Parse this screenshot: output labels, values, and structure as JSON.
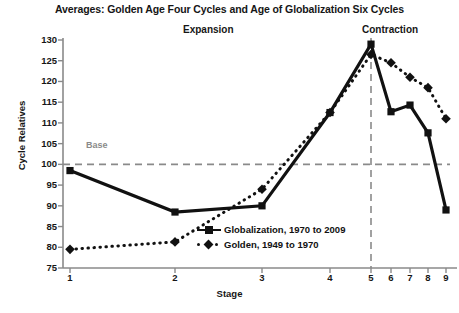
{
  "chart_data": {
    "type": "line",
    "title": "Averages: Golden Age Four Cycles and Age of Globalization Six Cycles",
    "xlabel": "Stage",
    "ylabel": "Cycle Relatives",
    "categories": [
      "1",
      "2",
      "3",
      "4",
      "5",
      "6",
      "7",
      "8",
      "9"
    ],
    "xtick_labels": [
      "1",
      "2",
      "3",
      "4",
      "5",
      "6",
      "7",
      "8",
      "9"
    ],
    "ytick_labels": [
      "130",
      "125",
      "120",
      "115",
      "110",
      "105",
      "100",
      "95",
      "90",
      "85",
      "80",
      "75"
    ],
    "ylim": [
      75,
      130
    ],
    "ytick_step": 5,
    "grid": false,
    "legend_position": "inside-center",
    "series": [
      {
        "name": "Globalization, 1970 to 2009",
        "style": "solid",
        "marker": "square",
        "color": "#111111",
        "x": [
          1,
          2,
          3,
          4,
          5,
          6,
          7,
          8,
          9
        ],
        "values": [
          98.5,
          88.5,
          90.0,
          112.5,
          129.0,
          112.7,
          114.3,
          107.6,
          89.0
        ]
      },
      {
        "name": "Golden, 1949 to 1970",
        "style": "dotted",
        "marker": "diamond",
        "color": "#111111",
        "x": [
          1,
          2,
          3,
          4,
          5,
          6,
          7,
          8,
          9
        ],
        "values": [
          79.5,
          81.3,
          94.0,
          112.5,
          126.5,
          124.5,
          121.0,
          118.5,
          111.0
        ]
      }
    ],
    "annotations": [
      {
        "name": "expansion",
        "text": "Expansion"
      },
      {
        "name": "contraction",
        "text": "Contraction"
      },
      {
        "name": "base",
        "text": "Base",
        "value": 100,
        "style": "dashed",
        "color": "#8a8a8a"
      },
      {
        "name": "stage5-divider",
        "value_x": 5,
        "style": "dashed",
        "color": "#8a8a8a"
      }
    ]
  },
  "labels": {
    "base": "Base",
    "expansion": "Expansion",
    "contraction": "Contraction"
  }
}
